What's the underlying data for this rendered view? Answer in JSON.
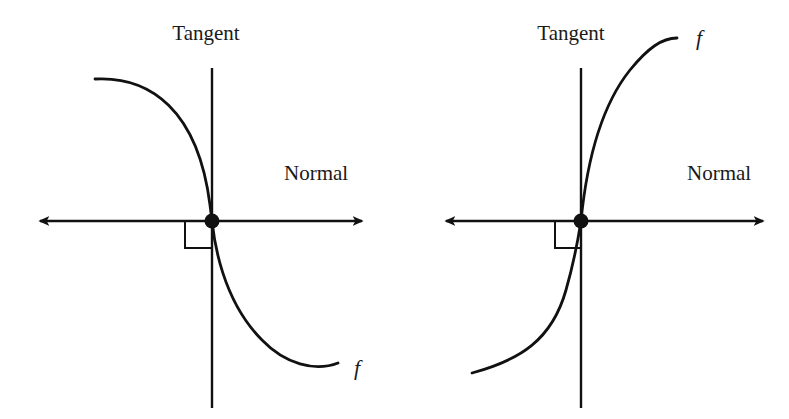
{
  "colors": {
    "ink": "#111111",
    "background": "#ffffff"
  },
  "panels": [
    {
      "id": "left",
      "tangent_label": "Tangent",
      "normal_label": "Normal",
      "function_label": "f",
      "curve_shape": "decreasing, vertical tangent at point, concave down above / concave up below",
      "marker": "right-angle-marker"
    },
    {
      "id": "right",
      "tangent_label": "Tangent",
      "normal_label": "Normal",
      "function_label": "f",
      "curve_shape": "increasing, vertical tangent at point, concave up below / concave down above",
      "marker": "right-angle-marker"
    }
  ]
}
